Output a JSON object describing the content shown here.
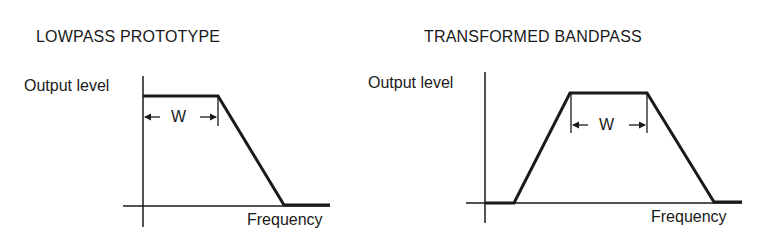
{
  "diagrams": [
    {
      "title": "LOWPASS PROTOTYPE",
      "y_label": "Output level",
      "x_label": "Frequency",
      "width_label": "W",
      "shape": "lowpass"
    },
    {
      "title": "TRANSFORMED BANDPASS",
      "y_label": "Output level",
      "x_label": "Frequency",
      "width_label": "W",
      "shape": "bandpass"
    }
  ],
  "colors": {
    "line": "#1a1a1a",
    "background": "#ffffff"
  }
}
